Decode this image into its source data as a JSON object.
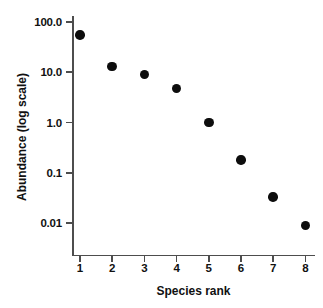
{
  "chart_data": {
    "type": "scatter",
    "title": "",
    "subtitle": "",
    "xlabel": "Species rank",
    "ylabel": "Abundance (log scale)",
    "x": [
      1,
      2,
      3,
      4,
      5,
      6,
      7,
      8
    ],
    "values": [
      55,
      13,
      9,
      4.7,
      1.0,
      0.18,
      0.033,
      0.009
    ],
    "categories": [
      "1",
      "2",
      "3",
      "4",
      "5",
      "6",
      "7",
      "8"
    ],
    "series": [
      {
        "name": "Abundance",
        "values": [
          55,
          13,
          9,
          4.7,
          1.0,
          0.18,
          0.033,
          0.009
        ]
      }
    ],
    "yscale": "log",
    "ylim": [
      0.005,
      150
    ],
    "xlim": [
      0.5,
      8.5
    ],
    "grid": false,
    "legend": false,
    "legend_position": "none",
    "marker": "filled-circle",
    "marker_color": "#0d0d0d",
    "y_ticks": [
      {
        "value": 100.0,
        "label": "100.0"
      },
      {
        "value": 10.0,
        "label": "10.0"
      },
      {
        "value": 1.0,
        "label": "1.0"
      },
      {
        "value": 0.1,
        "label": "0.1"
      },
      {
        "value": 0.01,
        "label": "0.01"
      }
    ],
    "x_ticks": [
      {
        "value": 1,
        "label": "1"
      },
      {
        "value": 2,
        "label": "2"
      },
      {
        "value": 3,
        "label": "3"
      },
      {
        "value": 4,
        "label": "4"
      },
      {
        "value": 5,
        "label": "5"
      },
      {
        "value": 6,
        "label": "6"
      },
      {
        "value": 7,
        "label": "7"
      },
      {
        "value": 8,
        "label": "8"
      }
    ],
    "annotations": [],
    "axis_color": "#4d4d4d",
    "text_color": "#111111",
    "background": "#ffffff"
  }
}
